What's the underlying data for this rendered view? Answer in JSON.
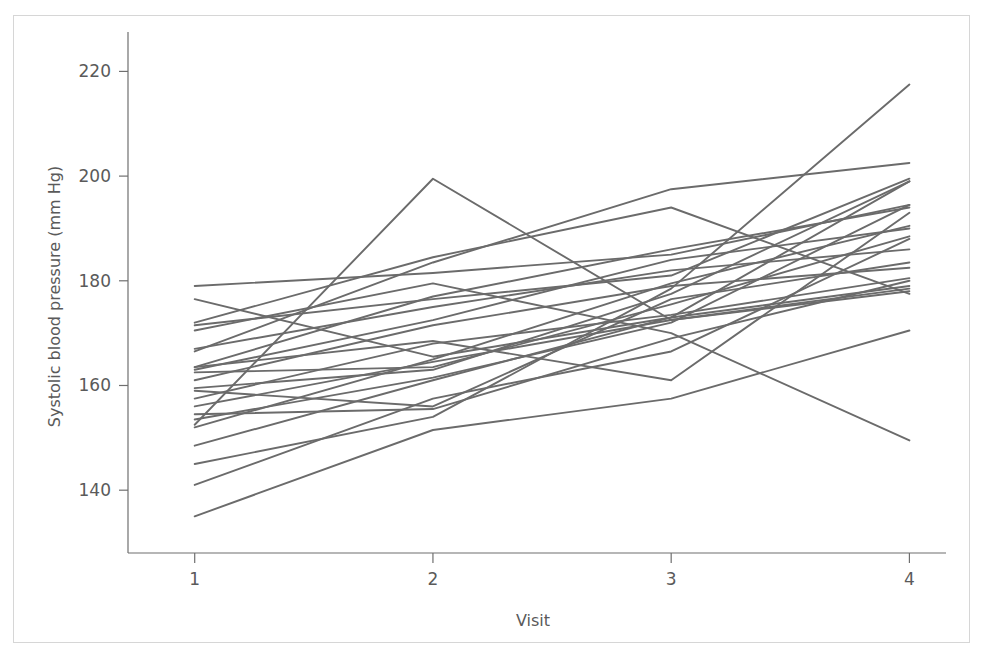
{
  "figure": {
    "caption_sliver": "",
    "background_color": "#ffffff",
    "frame_color": "#d6d6d6"
  },
  "chart_data": {
    "type": "line",
    "title": "",
    "subtitle": "",
    "xlabel": "Visit",
    "ylabel": "Systolic blood pressure (mm Hg)",
    "x": [
      1,
      2,
      3,
      4
    ],
    "x_tick_labels": [
      "1",
      "2",
      "3",
      "4"
    ],
    "y_tick_labels": [
      "140",
      "160",
      "180",
      "200",
      "220"
    ],
    "y_ticks": [
      140,
      160,
      180,
      200,
      220
    ],
    "xlim": [
      0.72,
      4.12
    ],
    "ylim": [
      128,
      226
    ],
    "grid": false,
    "legend": false,
    "legend_position": "none",
    "line_color": "#6b6b6b",
    "line_width": 1.9,
    "marker": "none",
    "n_subjects": 24,
    "annotations": [],
    "series": [
      {
        "name": "subject-01",
        "values": [
          179.0,
          181.5,
          185.0,
          194.5
        ]
      },
      {
        "name": "subject-02",
        "values": [
          176.5,
          165.5,
          173.0,
          199.0
        ]
      },
      {
        "name": "subject-03",
        "values": [
          172.0,
          184.5,
          194.0,
          177.5
        ]
      },
      {
        "name": "subject-04",
        "values": [
          171.5,
          176.5,
          181.0,
          199.5
        ]
      },
      {
        "name": "subject-05",
        "values": [
          166.5,
          183.5,
          197.5,
          202.5
        ]
      },
      {
        "name": "subject-06",
        "values": [
          163.5,
          177.0,
          186.0,
          194.0
        ]
      },
      {
        "name": "subject-07",
        "values": [
          163.0,
          172.5,
          184.0,
          190.0
        ]
      },
      {
        "name": "subject-08",
        "values": [
          162.5,
          163.5,
          175.5,
          188.5
        ]
      },
      {
        "name": "subject-09",
        "values": [
          161.0,
          171.5,
          179.0,
          182.5
        ]
      },
      {
        "name": "subject-10",
        "values": [
          159.5,
          163.0,
          177.5,
          199.0
        ]
      },
      {
        "name": "subject-11",
        "values": [
          157.5,
          168.0,
          173.5,
          180.5
        ]
      },
      {
        "name": "subject-12",
        "values": [
          156.0,
          164.5,
          172.5,
          178.0
        ]
      },
      {
        "name": "subject-13",
        "values": [
          154.5,
          155.5,
          169.0,
          180.0
        ]
      },
      {
        "name": "subject-14",
        "values": [
          153.5,
          161.5,
          172.0,
          194.5
        ]
      },
      {
        "name": "subject-15",
        "values": [
          152.5,
          199.5,
          172.5,
          178.5
        ]
      },
      {
        "name": "subject-16",
        "values": [
          152.0,
          165.0,
          179.5,
          190.5
        ]
      },
      {
        "name": "subject-17",
        "values": [
          159.0,
          156.0,
          176.5,
          183.5
        ]
      },
      {
        "name": "subject-18",
        "values": [
          148.5,
          161.0,
          173.0,
          179.0
        ]
      },
      {
        "name": "subject-19",
        "values": [
          163.5,
          168.5,
          161.0,
          193.0
        ]
      },
      {
        "name": "subject-20",
        "values": [
          145.0,
          154.0,
          178.5,
          217.5
        ]
      },
      {
        "name": "subject-21",
        "values": [
          141.0,
          157.5,
          166.5,
          188.0
        ]
      },
      {
        "name": "subject-22",
        "values": [
          135.0,
          151.5,
          157.5,
          170.5
        ]
      },
      {
        "name": "subject-23",
        "values": [
          170.5,
          179.5,
          170.0,
          149.5
        ]
      },
      {
        "name": "subject-24",
        "values": [
          167.0,
          175.0,
          182.0,
          186.0
        ]
      }
    ]
  },
  "axes": {
    "y_axis_name": "systolic-blood-pressure-axis",
    "x_axis_name": "visit-axis"
  }
}
